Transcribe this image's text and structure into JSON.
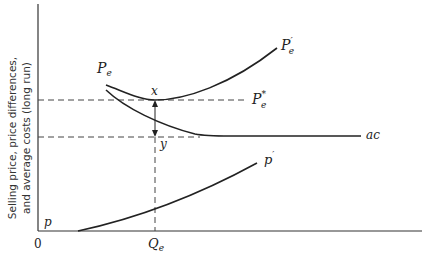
{
  "diagram": {
    "y_axis_label_line1": "Selling price, price differences,",
    "y_axis_label_line2": "and average costs (long run)",
    "origin_label": "0",
    "x_tick_label": "Q",
    "x_tick_sub": "e",
    "curves": {
      "pe_label": "P",
      "pe_sub": "e",
      "pe_prime_label": "P",
      "pe_prime_sup": "′",
      "pe_prime_sub": "e",
      "pe_star_label": "P",
      "pe_star_sup": "*",
      "pe_star_sub": "e",
      "ac_label": "ac",
      "p_label": "p",
      "p_prime_label": "p",
      "p_prime_sup": "′"
    },
    "points": {
      "x_label": "x",
      "y_label": "y"
    }
  },
  "colors": {
    "ink": "#222222",
    "background": "#ffffff"
  }
}
